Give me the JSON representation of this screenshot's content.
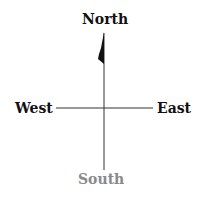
{
  "diagram": {
    "type": "compass",
    "labels": {
      "north": "North",
      "south": "South",
      "east": "East",
      "west": "West"
    },
    "colors": {
      "cardinal_text": "#111111",
      "south_text": "#8a8a8a",
      "lines": "#333333",
      "arrow": "#111111"
    },
    "pointer_direction": "north"
  }
}
